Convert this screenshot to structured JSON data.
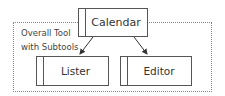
{
  "diagram": {
    "container": {
      "label_line1": "Overall Tool",
      "label_line2": "with Subtools"
    },
    "nodes": [
      {
        "id": "calendar",
        "label": "Calendar"
      },
      {
        "id": "lister",
        "label": "Lister"
      },
      {
        "id": "editor",
        "label": "Editor"
      }
    ],
    "edges": [
      {
        "from": "calendar",
        "to": "lister"
      },
      {
        "from": "calendar",
        "to": "editor"
      }
    ]
  }
}
